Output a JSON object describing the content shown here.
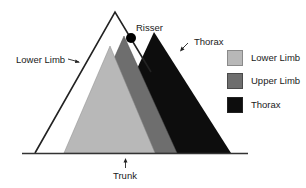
{
  "diagram": {
    "labels": {
      "outline": "Lower Limb",
      "risser": "Risser",
      "thorax": "Thorax",
      "baseline": "Trunk"
    },
    "legend": [
      {
        "label": "Lower Limb",
        "color": "#b8b8b8"
      },
      {
        "label": "Upper Limb",
        "color": "#6e6e6e"
      },
      {
        "label": "Thorax",
        "color": "#0d0d0d"
      }
    ],
    "colors": {
      "outline_stroke": "#222222",
      "baseline": "#333333",
      "risser_dot": "#000000"
    }
  }
}
